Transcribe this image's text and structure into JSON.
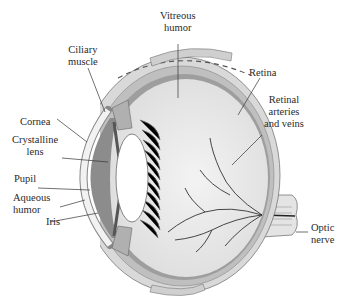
{
  "diagram": {
    "colors": {
      "sclera": "#d9d9d9",
      "choroid": "#bfbfbf",
      "retina": "#9e9e9e",
      "vitreous": "#ececec",
      "aqueous": "#8c8c8c",
      "lens": "#ffffff",
      "ciliary": "#b0b0b0",
      "vessels": "#333333",
      "text": "#2a2a2a"
    },
    "labels": {
      "vitreous_humor": [
        "Vitreous",
        "humor"
      ],
      "ciliary_muscle": [
        "Ciliary",
        "muscle"
      ],
      "retina": [
        "Retina"
      ],
      "retinal_vessels": [
        "Retinal",
        "arteries",
        "and veins"
      ],
      "cornea": [
        "Cornea"
      ],
      "crystalline_lens": [
        "Crystalline",
        "lens"
      ],
      "pupil": [
        "Pupil"
      ],
      "aqueous_humor": [
        "Aqueous",
        "humor"
      ],
      "iris": [
        "Iris"
      ],
      "optic_nerve": [
        "Optic",
        "nerve"
      ]
    }
  }
}
